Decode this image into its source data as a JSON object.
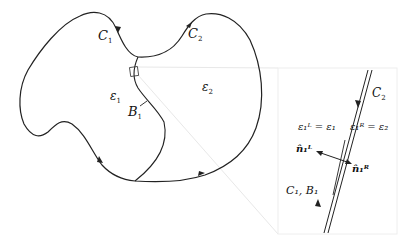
{
  "diagram": {
    "main_labels": {
      "c1": "C",
      "c1_sub": "1",
      "c2": "C",
      "c2_sub": "2",
      "eps1": "ε",
      "eps1_sub": "1",
      "eps2": "ε",
      "eps2_sub": "2",
      "b1": "B",
      "b1_sub": "1"
    },
    "inset_labels": {
      "c2": "C",
      "c2_sub": "2",
      "eq_left": "ε₁ᴸ = ε₁",
      "eq_right": "ε₁ᴿ = ε₂",
      "n_left": "n̂₁ᴸ",
      "n_right": "n̂₁ᴿ",
      "c1b1": "C₁, B₁"
    },
    "colors": {
      "stroke": "#222222",
      "zoom_lines": "#e6e6e6"
    }
  }
}
